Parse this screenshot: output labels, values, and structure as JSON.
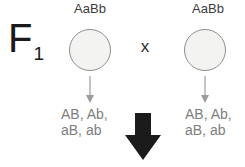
{
  "diagram": {
    "generation_label": "F",
    "generation_subscript": "1",
    "cross_symbol": "x",
    "parents": [
      {
        "genotype": "AaBb",
        "gametes_line1": "AB, Ab,",
        "gametes_line2": "aB, ab"
      },
      {
        "genotype": "AaBb",
        "gametes_line1": "AB, Ab,",
        "gametes_line2": "aB, ab"
      }
    ],
    "colors": {
      "background": "#ffffff",
      "circle_fill": "#f3f3f1",
      "circle_stroke": "#8f8f8f",
      "genotype_text": "#3c3c3c",
      "gamete_text": "#7e7e7e",
      "small_arrow": "#9b9b9b",
      "big_arrow": "#1b1b1b"
    }
  }
}
